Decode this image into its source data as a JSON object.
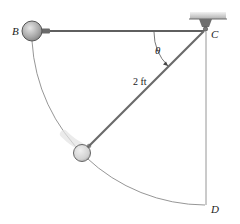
{
  "figure": {
    "type": "pendulum-diagram",
    "labels": {
      "point_b": "B",
      "point_c": "C",
      "point_d": "D",
      "angle": "θ",
      "rod_length": "2 ft"
    },
    "colors": {
      "rod": "#6b6b6b",
      "guide_line": "#8a8a8a",
      "ball_fill": "#bdbdbd",
      "ball_stroke": "#555555",
      "ceiling": "#b8b8b8",
      "text": "#222222"
    }
  }
}
